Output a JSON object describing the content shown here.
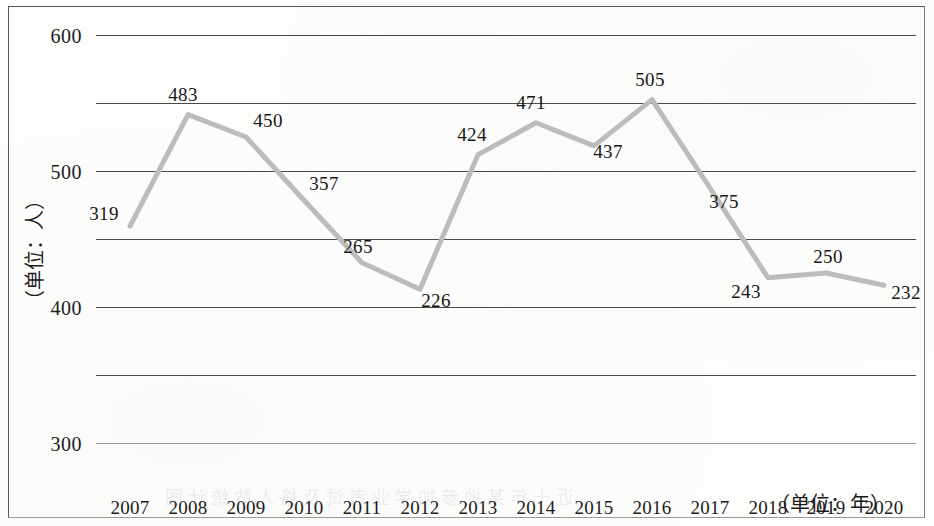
{
  "chart_data": {
    "type": "line",
    "title": "",
    "subtitle": "",
    "xlabel": "（单位：年）",
    "ylabel": "（单位：人）",
    "categories": [
      "2007",
      "2008",
      "2009",
      "2010",
      "2011",
      "2012",
      "2013",
      "2014",
      "2015",
      "2016",
      "2017",
      "2018",
      "2019",
      "2020"
    ],
    "values": [
      319,
      483,
      450,
      357,
      265,
      226,
      424,
      471,
      437,
      505,
      375,
      243,
      250,
      232
    ],
    "series": [
      {
        "name": "人数",
        "values": [
          319,
          483,
          450,
          357,
          265,
          226,
          424,
          471,
          437,
          505,
          375,
          243,
          250,
          232
        ]
      }
    ],
    "ylim": [
      0,
      600
    ],
    "y_ticks": [
      0,
      100,
      200,
      300,
      400,
      500,
      600
    ],
    "y_tick_labels": [
      "0",
      "100",
      "200",
      "300",
      "400",
      "500",
      "600"
    ],
    "grid": true,
    "grid_axis": "y",
    "legend": false,
    "legend_position": "none",
    "data_labels": [
      "319",
      "483",
      "450",
      "357",
      "265",
      "226",
      "424",
      "471",
      "437",
      "505",
      "375",
      "243",
      "250",
      "232"
    ],
    "line_color": "#bcbcbc",
    "grid_color": "#4a4a4a",
    "text_color": "#1b1b1b",
    "background_color": "#fdfdfc"
  },
  "figure": {
    "frame_border_color": "#5a5a5a",
    "bleed_through_text": "近十年某地参加学业考试及格人数统计图"
  }
}
